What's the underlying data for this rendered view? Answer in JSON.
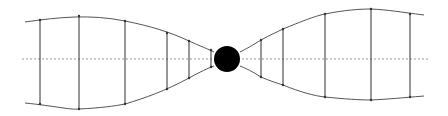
{
  "diagram": {
    "colors": {
      "background": "#ffffff",
      "outline": "#555555",
      "chords": "#333333",
      "axis": "#9a9a9a",
      "sphere": "#000000"
    },
    "axis": {
      "x1": 22,
      "x2": 428,
      "y": 59
    },
    "sphere": {
      "cx": 227,
      "cy": 59,
      "r": 13
    },
    "left_envelope": {
      "top": "M25,22 C60,17 90,14 125,21 C150,26 170,32 189,41 C200,46 208,49 214,52",
      "bottom": "M25,103 C55,106 70,110 79,109 C100,108 115,106 125,104 C145,98 165,91 189,78 C200,72 208,68 214,66"
    },
    "right_envelope": {
      "top": "M240,52 C250,47 256,43 261,40 C270,35 277,32 283,29 C300,22 315,16 325,14 C345,10 360,9 371,9 C390,10 400,12 424,15",
      "bottom": "M240,66 C250,70 256,74 261,77 C270,81 277,83 283,85 C300,92 315,96 325,97 C345,99 360,100 371,100 C390,99 400,98 424,96"
    },
    "chords": [
      {
        "x": 40,
        "y1": 20,
        "y2": 104
      },
      {
        "x": 79,
        "y1": 16,
        "y2": 109
      },
      {
        "x": 125,
        "y1": 21,
        "y2": 104
      },
      {
        "x": 167,
        "y1": 33,
        "y2": 89
      },
      {
        "x": 189,
        "y1": 41,
        "y2": 78
      },
      {
        "x": 211,
        "y1": 50,
        "y2": 67
      },
      {
        "x": 261,
        "y1": 40,
        "y2": 77
      },
      {
        "x": 283,
        "y1": 29,
        "y2": 85
      },
      {
        "x": 325,
        "y1": 14,
        "y2": 97
      },
      {
        "x": 371,
        "y1": 9,
        "y2": 100
      },
      {
        "x": 410,
        "y1": 14,
        "y2": 97
      }
    ]
  }
}
